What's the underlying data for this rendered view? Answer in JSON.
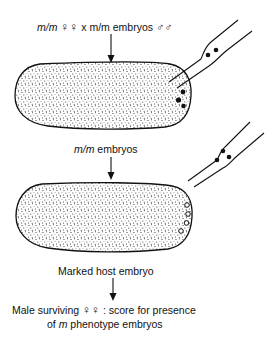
{
  "step1": {
    "genotype_italic": "m/m",
    "female_symbol": "♀♀",
    "cross_text": " x m/m embryos ",
    "male_symbol": "♂♂"
  },
  "step2": {
    "genotype_italic": "m/m",
    "text": " embryos"
  },
  "step3": {
    "text": "Marked host embryo"
  },
  "step4": {
    "line1_prefix": "Male surviving ",
    "female_symbol": "♀♀",
    "line1_suffix": " : score for presence",
    "line2_prefix": "of ",
    "line2_italic": "m",
    "line2_suffix": " phenotype embryos"
  },
  "colors": {
    "ink": "#111111",
    "background": "#ffffff"
  }
}
